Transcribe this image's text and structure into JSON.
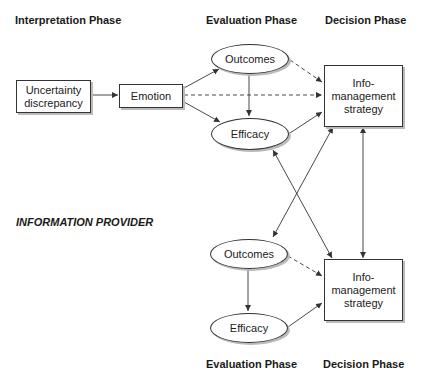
{
  "headers": {
    "top": {
      "interpretation": "Interpretation Phase",
      "evaluation": "Evaluation Phase",
      "decision": "Decision Phase"
    },
    "bottom": {
      "evaluation": "Evaluation Phase",
      "decision": "Decision Phase"
    }
  },
  "provider_label": "INFORMATION PROVIDER",
  "nodes": {
    "uncertainty": {
      "line1": "Uncertainty",
      "line2": "discrepancy"
    },
    "emotion": "Emotion",
    "top_outcomes": "Outcomes",
    "top_efficacy": "Efficacy",
    "top_strategy": {
      "line1": "Info-",
      "line2": "management",
      "line3": "strategy"
    },
    "bottom_outcomes": "Outcomes",
    "bottom_efficacy": "Efficacy",
    "bottom_strategy": {
      "line1": "Info-",
      "line2": "management",
      "line3": "strategy"
    }
  },
  "edges": [
    {
      "from": "uncertainty",
      "to": "emotion",
      "style": "solid"
    },
    {
      "from": "emotion",
      "to": "top_outcomes",
      "style": "solid"
    },
    {
      "from": "emotion",
      "to": "top_efficacy",
      "style": "solid"
    },
    {
      "from": "emotion",
      "to": "top_strategy",
      "style": "dashed"
    },
    {
      "from": "top_outcomes",
      "to": "top_efficacy",
      "style": "solid"
    },
    {
      "from": "top_outcomes",
      "to": "top_strategy",
      "style": "dashed"
    },
    {
      "from": "top_efficacy",
      "to": "top_strategy",
      "style": "solid"
    },
    {
      "from": "top_strategy",
      "to": "bottom_outcomes",
      "style": "solid",
      "bidirectional": true
    },
    {
      "from": "top_efficacy",
      "to": "bottom_strategy",
      "style": "solid",
      "bidirectional": true
    },
    {
      "from": "top_strategy",
      "to": "bottom_strategy",
      "style": "solid",
      "bidirectional": true
    },
    {
      "from": "bottom_outcomes",
      "to": "bottom_efficacy",
      "style": "solid"
    },
    {
      "from": "bottom_outcomes",
      "to": "bottom_strategy",
      "style": "dashed"
    },
    {
      "from": "bottom_efficacy",
      "to": "bottom_strategy",
      "style": "solid"
    }
  ]
}
